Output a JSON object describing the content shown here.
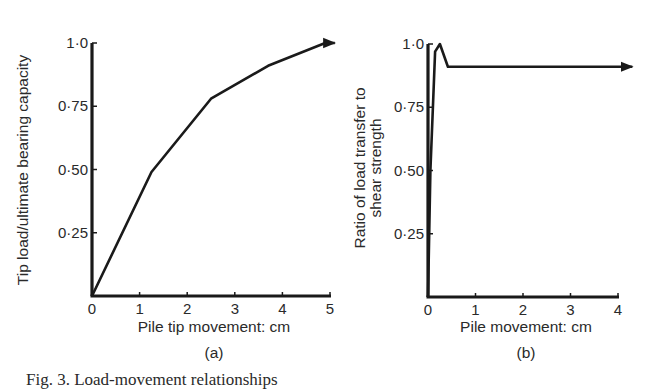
{
  "figure": {
    "caption": "Fig. 3. Load-movement relationships"
  },
  "chart_data": [
    {
      "panel": "(a)",
      "type": "line",
      "title": "",
      "xlabel": "Pile tip movement: cm",
      "ylabel": "Tip load/ultimate bearing capacity",
      "xlim": [
        0,
        5
      ],
      "ylim": [
        0,
        1.0
      ],
      "x_ticks": [
        "0",
        "1",
        "2",
        "3",
        "4",
        "5"
      ],
      "y_ticks": [
        "0·25",
        "0·50",
        "0·75",
        "1·0"
      ],
      "grid": false,
      "legend": null,
      "series": [
        {
          "name": "tip load ratio",
          "x": [
            0,
            1.25,
            2.5,
            3.7,
            4.9,
            5.1
          ],
          "y": [
            0,
            0.49,
            0.78,
            0.91,
            1.0,
            1.0
          ],
          "end_arrow": true
        }
      ]
    },
    {
      "panel": "(b)",
      "type": "line",
      "title": "",
      "xlabel": "Pile movement: cm",
      "ylabel": "Ratio of load transfer to shear strength",
      "ylabel_lines": [
        "Ratio of load transfer to",
        "shear strength"
      ],
      "xlim": [
        0,
        4
      ],
      "ylim": [
        0,
        1.0
      ],
      "x_ticks": [
        "0",
        "1",
        "2",
        "3",
        "4"
      ],
      "y_ticks": [
        "0·25",
        "0·50",
        "0·75",
        "1·0"
      ],
      "grid": false,
      "legend": null,
      "series": [
        {
          "name": "load transfer ratio",
          "x": [
            0,
            0.05,
            0.15,
            0.25,
            0.42,
            4.3
          ],
          "y": [
            0,
            0.5,
            0.97,
            1.0,
            0.91,
            0.91
          ],
          "end_arrow": true
        }
      ]
    }
  ]
}
